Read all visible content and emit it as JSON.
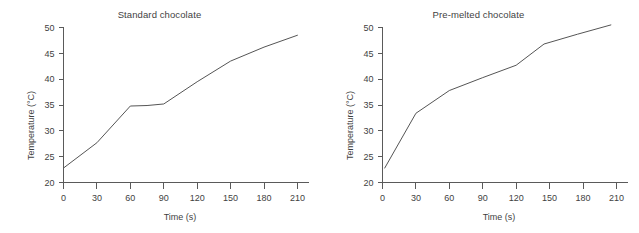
{
  "figure": {
    "background_color": "#ffffff",
    "line_color": "#555555",
    "axis_color": "#5a5a5a",
    "text_color": "#3f3f3f"
  },
  "panels": [
    {
      "title": "Standard chocolate",
      "xlabel": "Time (s)",
      "ylabel": "Temperature (°C)"
    },
    {
      "title": "Pre-melted chocolate",
      "xlabel": "Time (s)",
      "ylabel": "Temperature (°C)"
    }
  ],
  "chart_data": [
    {
      "type": "line",
      "title": "Standard chocolate",
      "xlabel": "Time (s)",
      "ylabel": "Temperature (°C)",
      "xlim": [
        0,
        215
      ],
      "ylim": [
        20,
        50
      ],
      "xticks": [
        0,
        30,
        60,
        90,
        120,
        150,
        180,
        210
      ],
      "yticks": [
        20,
        25,
        30,
        35,
        40,
        45,
        50
      ],
      "xticklabels": [
        "0",
        "30",
        "60",
        "90",
        "120",
        "150",
        "180",
        "210"
      ],
      "yticklabels": [
        "20",
        "25",
        "30",
        "35",
        "40",
        "45",
        "50"
      ],
      "grid": false,
      "legend": "none",
      "series": [
        {
          "name": "Standard chocolate",
          "x": [
            0,
            30,
            60,
            75,
            90,
            120,
            150,
            180,
            210
          ],
          "y": [
            22.8,
            27.7,
            34.8,
            34.9,
            35.2,
            39.5,
            43.5,
            46.2,
            48.5
          ]
        }
      ]
    },
    {
      "type": "line",
      "title": "Pre-melted chocolate",
      "xlabel": "Time (s)",
      "ylabel": "Temperature (°C)",
      "xlim": [
        0,
        215
      ],
      "ylim": [
        20,
        50
      ],
      "xticks": [
        0,
        30,
        60,
        90,
        120,
        150,
        180,
        210
      ],
      "yticks": [
        20,
        25,
        30,
        35,
        40,
        45,
        50
      ],
      "xticklabels": [
        "0",
        "30",
        "60",
        "90",
        "120",
        "150",
        "180",
        "210"
      ],
      "yticklabels": [
        "20",
        "25",
        "30",
        "35",
        "40",
        "45",
        "50"
      ],
      "grid": false,
      "legend": "none",
      "series": [
        {
          "name": "Pre-melted chocolate",
          "x": [
            2,
            30,
            60,
            90,
            120,
            145,
            175,
            205
          ],
          "y": [
            22.8,
            33.4,
            37.8,
            40.3,
            42.7,
            46.8,
            48.7,
            50.5
          ]
        }
      ]
    }
  ]
}
